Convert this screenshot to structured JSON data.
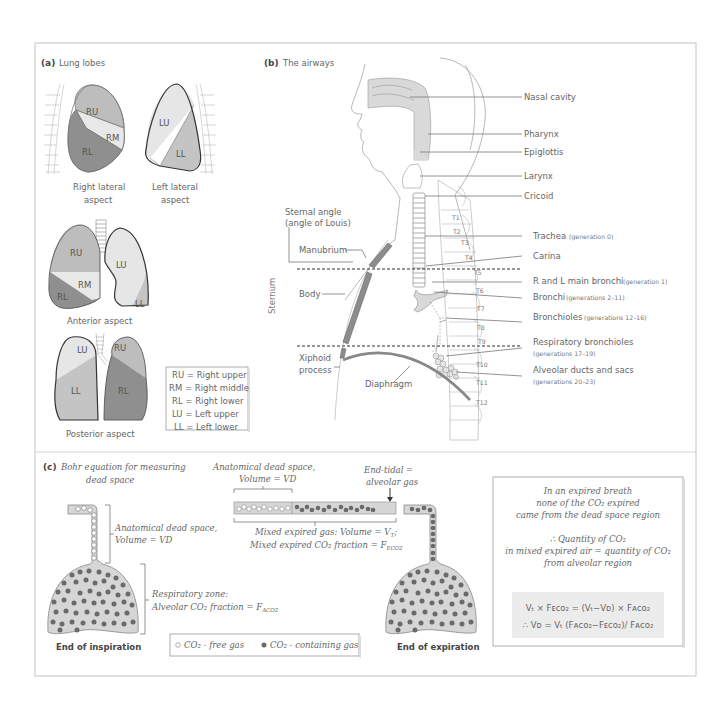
{
  "colors": {
    "frame": "#bdbdbd",
    "text": "#666666",
    "lobe_upper_right": "#bdbdbd",
    "lobe_middle": "#e8e8e8",
    "lobe_lower_right": "#8f8f8f",
    "lobe_upper_left": "#e6e6e6",
    "lobe_lower_left": "#c4c4c4",
    "airway_fill": "#d9d9d9",
    "sternum_fill": "#8c8c8c",
    "co2_dot": "#6a6a6a",
    "alveolar_bg": "#d6d6d6",
    "equation_bg": "#ececec"
  },
  "panel_a": {
    "letter": "(a)",
    "title": "Lung lobes",
    "right_lateral": {
      "lobes": [
        "RU",
        "RM",
        "RL"
      ],
      "caption_line1": "Right lateral",
      "caption_line2": "aspect"
    },
    "left_lateral": {
      "lobes": [
        "LU",
        "LL"
      ],
      "caption_line1": "Left lateral",
      "caption_line2": "aspect"
    },
    "anterior": {
      "lobes": [
        "RU",
        "RM",
        "RL",
        "LU",
        "LL"
      ],
      "caption": "Anterior aspect"
    },
    "posterior": {
      "lobes": [
        "LU",
        "LL",
        "RU",
        "RL"
      ],
      "caption": "Posterior aspect"
    },
    "legend": [
      "RU = Right upper",
      "RM = Right middle",
      "RL = Right lower",
      "LU = Left upper",
      "LL = Left lower"
    ]
  },
  "panel_b": {
    "letter": "(b)",
    "title": "The airways",
    "labels": {
      "nasal_cavity": "Nasal cavity",
      "pharynx": "Pharynx",
      "epiglottis": "Epiglottis",
      "larynx": "Larynx",
      "cricoid": "Cricoid",
      "trachea": "Trachea",
      "trachea_gen": "(generation 0)",
      "carina": "Carina",
      "main_bronchi": "R and L main bronchi",
      "main_bronchi_gen": "(generation 1)",
      "bronchi": "Bronchi",
      "bronchi_gen": "(generations 2–11)",
      "bronchioles": "Bronchioles",
      "bronchioles_gen": "(generations 12–16)",
      "resp_bronchioles": "Respiratory bronchioles",
      "resp_bronchioles_gen": "(generations 17–19)",
      "alveolar": "Alveolar ducts and sacs",
      "alveolar_gen": "(generations 20–23)",
      "sternal_angle_1": "Sternal angle",
      "sternal_angle_2": "(angle of Louis)",
      "manubrium": "Manubrium",
      "body": "Body",
      "xiphoid_1": "Xiphoid",
      "xiphoid_2": "process",
      "diaphragm": "Diaphragm",
      "sternum": "Sternum"
    },
    "vertebrae": [
      "T1",
      "T2",
      "T3",
      "T4",
      "T5",
      "T6",
      "T7",
      "T8",
      "T9",
      "T10",
      "T11",
      "T12"
    ]
  },
  "panel_c": {
    "letter": "(c)",
    "title_line1": "Bohr equation for measuring",
    "title_line2": "dead space",
    "dead_space_1": "Anatomical dead space,",
    "dead_space_2": "Volume = VD",
    "resp_zone_1": "Respiratory zone:",
    "resp_zone_2": "Alveolar CO₂ fraction = F",
    "resp_zone_sub": "ACO2",
    "tube_dead_1": "Anatomical dead space,",
    "tube_dead_2": "Volume = VD",
    "end_tidal_1": "End-tidal =",
    "end_tidal_2": "alveolar gas",
    "mixed_1": "Mixed expired gas: Volume = V",
    "mixed_1_sub": "T",
    "mixed_1_end": ";",
    "mixed_2": "Mixed expired CO₂ fraction = F",
    "mixed_2_sub": "ECO2",
    "caption_inspiration": "End of inspiration",
    "caption_expiration": "End of expiration",
    "legend_free": "CO₂ - free gas",
    "legend_containing": "CO₂ - containing gas",
    "explanation": [
      "In an expired breath",
      "none of the CO₂ expired",
      "came from the dead space region",
      "",
      "∴ Quantity of CO₂",
      "in mixed expired air = quantity of CO₂",
      "from alveolar region"
    ],
    "equation_1": "Vₜ × Fᴇᴄᴏ₂ = (Vₜ−Vᴅ) × Fᴀᴄᴏ₂",
    "equation_2": "∴ Vᴅ = Vₜ (Fᴀᴄᴏ₂−Fᴇᴄᴏ₂)/ Fᴀᴄᴏ₂"
  }
}
